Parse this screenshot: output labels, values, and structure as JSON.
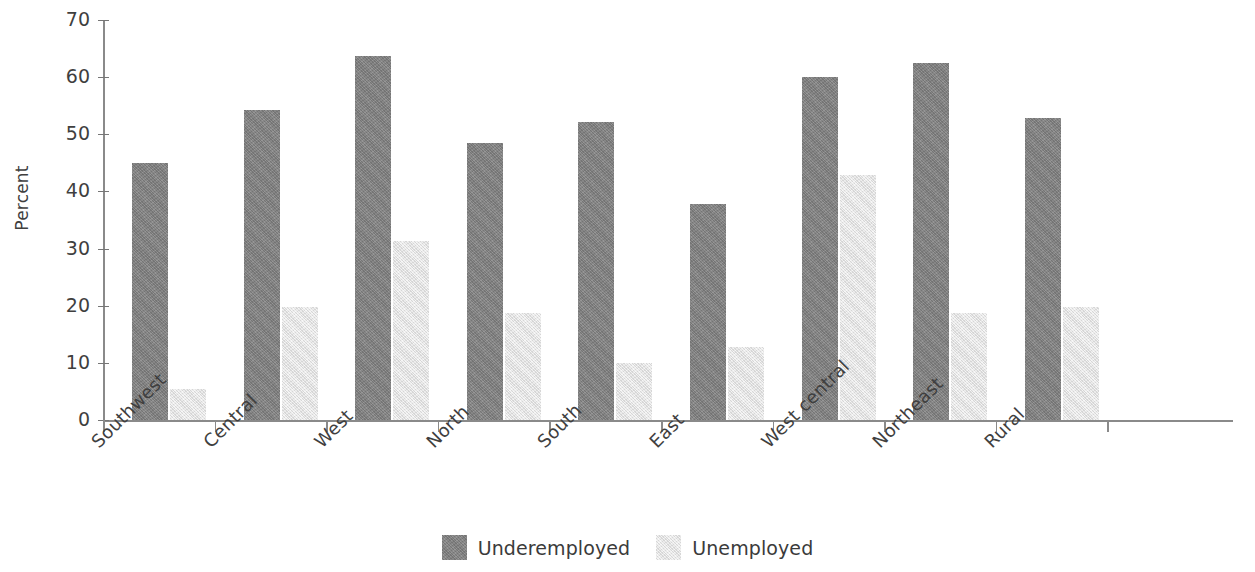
{
  "chart_data": {
    "type": "bar",
    "title": "",
    "subtitle": "",
    "xlabel": "",
    "ylabel": "Percent",
    "ylim": [
      0,
      70
    ],
    "yticks": [
      0,
      10,
      20,
      30,
      40,
      50,
      60,
      70
    ],
    "ytick_labels": [
      "0",
      "10",
      "20",
      "30",
      "40",
      "50",
      "60",
      "70"
    ],
    "grid": false,
    "legend_position": "bottom-center",
    "categories": [
      "Southwest",
      "Central",
      "West",
      "North",
      "South",
      "East",
      "West central",
      "Northeast",
      "Rural"
    ],
    "series": [
      {
        "name": "Underemployed",
        "color": "#828282",
        "values": [
          45.0,
          54.3,
          63.7,
          48.5,
          52.1,
          37.8,
          60.0,
          62.4,
          52.8
        ]
      },
      {
        "name": "Unemployed",
        "color": "#eaeaea",
        "values": [
          5.4,
          19.7,
          31.4,
          18.8,
          9.9,
          12.7,
          42.8,
          18.7,
          19.8
        ]
      }
    ]
  },
  "axis": {
    "y_title": "Percent"
  },
  "legend": {
    "items": [
      {
        "label": "Underemployed",
        "color": "#828282"
      },
      {
        "label": "Unemployed",
        "color": "#eaeaea"
      }
    ]
  }
}
